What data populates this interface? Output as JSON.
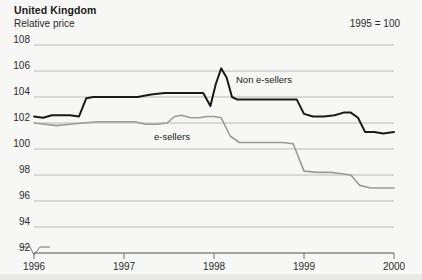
{
  "header": {
    "title": "United Kingdom",
    "subtitle": "Relative price",
    "note": "1995 = 100"
  },
  "labels": {
    "series_non_esellers": "Non e-sellers",
    "series_esellers": "e-sellers"
  },
  "chart_data": {
    "type": "line",
    "title": "United Kingdom",
    "subtitle": "Relative price",
    "annotation": "1995 = 100",
    "xlabel": "",
    "ylabel": "Relative price",
    "xlim": [
      1996,
      2000
    ],
    "ylim": [
      92,
      108
    ],
    "yticks": [
      92,
      94,
      96,
      98,
      100,
      102,
      104,
      106,
      108
    ],
    "ytick_labels": [
      "92",
      "94",
      "96",
      "98",
      "100",
      "102",
      "104",
      "106",
      "108"
    ],
    "xticks": [
      1996,
      1997,
      1998,
      1999,
      2000
    ],
    "xtick_labels": [
      "1996",
      "1997",
      "1998",
      "1999",
      "2000"
    ],
    "grid": true,
    "grid_axis": "y",
    "axis_break": true,
    "legend": "inline-labels",
    "colors": {
      "non_esellers": "#1a1a1a",
      "esellers": "#9a9a9a",
      "grid": "#b8b8b4",
      "background": "#f7f7f5"
    },
    "series": [
      {
        "name": "Non e-sellers",
        "color": "#1a1a1a",
        "x": [
          1996.0,
          1996.1,
          1996.2,
          1996.3,
          1996.4,
          1996.5,
          1996.58,
          1996.66,
          1996.75,
          1996.85,
          1997.0,
          1997.15,
          1997.3,
          1997.45,
          1997.6,
          1997.75,
          1997.88,
          1997.96,
          1998.02,
          1998.08,
          1998.14,
          1998.2,
          1998.26,
          1998.34,
          1998.45,
          1998.58,
          1998.7,
          1998.82,
          1998.92,
          1999.0,
          1999.1,
          1999.22,
          1999.34,
          1999.44,
          1999.52,
          1999.6,
          1999.68,
          1999.78,
          1999.88,
          2000.0
        ],
        "values": [
          102.5,
          102.4,
          102.6,
          102.6,
          102.6,
          102.5,
          103.9,
          104.0,
          104.0,
          104.0,
          104.0,
          104.0,
          104.2,
          104.3,
          104.3,
          104.3,
          104.3,
          103.3,
          105.0,
          106.2,
          105.5,
          104.0,
          103.8,
          103.8,
          103.8,
          103.8,
          103.8,
          103.8,
          103.8,
          102.7,
          102.5,
          102.5,
          102.6,
          102.8,
          102.8,
          102.4,
          101.3,
          101.3,
          101.2,
          101.3
        ]
      },
      {
        "name": "e-sellers",
        "color": "#9a9a9a",
        "x": [
          1996.0,
          1996.12,
          1996.25,
          1996.4,
          1996.55,
          1996.7,
          1996.85,
          1997.0,
          1997.12,
          1997.24,
          1997.36,
          1997.48,
          1997.56,
          1997.64,
          1997.74,
          1997.84,
          1997.92,
          1998.0,
          1998.08,
          1998.18,
          1998.28,
          1998.4,
          1998.52,
          1998.64,
          1998.76,
          1998.88,
          1999.0,
          1999.15,
          1999.3,
          1999.42,
          1999.52,
          1999.62,
          1999.74,
          1999.86,
          2000.0
        ],
        "values": [
          102.0,
          101.9,
          101.8,
          101.9,
          102.0,
          102.1,
          102.1,
          102.1,
          102.1,
          101.9,
          101.9,
          102.0,
          102.5,
          102.6,
          102.4,
          102.4,
          102.5,
          102.5,
          102.4,
          101.0,
          100.5,
          100.5,
          100.5,
          100.5,
          100.5,
          100.4,
          98.3,
          98.2,
          98.2,
          98.1,
          98.0,
          97.2,
          97.0,
          97.0,
          97.0
        ]
      }
    ]
  }
}
